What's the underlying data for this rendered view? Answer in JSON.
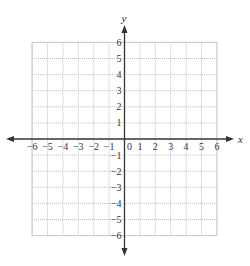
{
  "chart_data": {
    "type": "scatter",
    "title": "",
    "xlabel": "x",
    "ylabel": "y",
    "xlim": [
      -6,
      6
    ],
    "ylim": [
      -6,
      6
    ],
    "grid": true,
    "grid_style": "dotted",
    "x_ticks": [
      -6,
      -5,
      -4,
      -3,
      -2,
      -1,
      0,
      1,
      2,
      3,
      4,
      5,
      6
    ],
    "y_ticks": [
      -6,
      -5,
      -4,
      -3,
      -2,
      -1,
      1,
      2,
      3,
      4,
      5,
      6
    ],
    "x_tick_labels": [
      "−6",
      "−5",
      "−4",
      "−3",
      "−2",
      "−1",
      "0",
      "1",
      "2",
      "3",
      "4",
      "5",
      "6"
    ],
    "y_tick_labels": [
      "−6",
      "−5",
      "−4",
      "−3",
      "−2",
      "−1",
      "1",
      "2",
      "3",
      "4",
      "5",
      "6"
    ],
    "series": [],
    "legend": null
  },
  "layout": {
    "origin_x": 124.5,
    "origin_y": 139,
    "unit_x": 15.4,
    "unit_y": 16.1,
    "axis_color": "#333333",
    "grid_color": "#bbbbbb"
  }
}
